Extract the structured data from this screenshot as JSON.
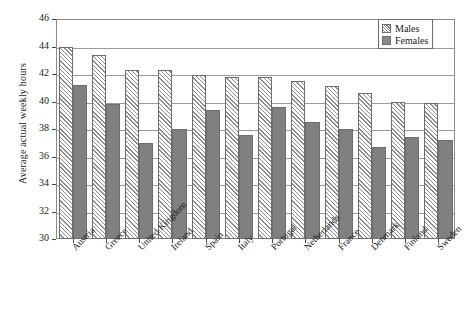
{
  "chart_data": {
    "type": "bar",
    "title": "",
    "xlabel": "",
    "ylabel": "Average actual weekly hours",
    "ylim": [
      30,
      46
    ],
    "ytick_step": 2,
    "yticks": [
      46,
      44,
      42,
      40,
      38,
      36,
      34,
      32,
      30
    ],
    "grid": true,
    "legend_position": "top-right",
    "categories": [
      "Austria",
      "Greece",
      "United Kingdom",
      "Ireland",
      "Spain",
      "Italy",
      "Portugal",
      "Netherlands",
      "France",
      "Denmark",
      "Finland",
      "Sweden"
    ],
    "series": [
      {
        "name": "Males",
        "pattern": "diagonal-hatch",
        "color": "#ffffff",
        "values": [
          44.0,
          43.4,
          42.3,
          42.3,
          41.9,
          41.8,
          41.8,
          41.5,
          41.1,
          40.6,
          40.0,
          39.9
        ]
      },
      {
        "name": "Females",
        "pattern": "solid",
        "color": "#808080",
        "values": [
          41.2,
          39.8,
          37.0,
          38.0,
          39.4,
          37.6,
          39.6,
          38.5,
          38.0,
          36.7,
          37.4,
          37.2
        ]
      }
    ]
  },
  "legend": {
    "items": [
      {
        "label": "Males"
      },
      {
        "label": "Females"
      }
    ]
  }
}
